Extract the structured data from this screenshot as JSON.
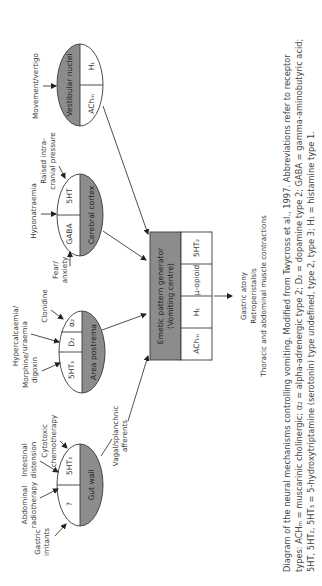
{
  "diagram": {
    "nodes": {
      "gut_wall": {
        "name": "Gut wall",
        "receptors": [
          "?",
          "5HT₃"
        ]
      },
      "area_postrema": {
        "name": "Area postrema",
        "receptors": [
          "5HT₃",
          "D₂",
          "α₂"
        ]
      },
      "cerebral_cortex": {
        "name": "Cerebral cortex",
        "receptors": [
          "GABA",
          "5HT"
        ]
      },
      "vestibular_nuclei": {
        "name": "Vestibular nuclei",
        "receptors": [
          "AChₘ",
          "H₁"
        ]
      },
      "emetic_generator": {
        "name_line1": "Emetic pattern generator",
        "name_line2": "(Vomiting centre)",
        "receptors": [
          "AChₘ",
          "H₁",
          "μ-opioid",
          "5HT₂"
        ]
      }
    },
    "stimuli": {
      "gastric_irritants": [
        "Gastric",
        "irritants"
      ],
      "abdominal_radiotherapy": [
        "Abdominal",
        "radiotherapy"
      ],
      "intestinal_distension": [
        "Intestinal",
        "distension"
      ],
      "cytotoxic_chemotherapy": [
        "Cytotoxic",
        "chemotherapy"
      ],
      "morphine_digoxin": [
        "Morphine/",
        "digoxin"
      ],
      "hypercalcaemia_uraemia": [
        "Hypercalcaemia/",
        "uraemia"
      ],
      "clonidine": [
        "Clonidine"
      ],
      "fear_anxiety": [
        "Fear/",
        "anxiety"
      ],
      "hyponatraemia": [
        "Hyponatraemia"
      ],
      "raised_icp": [
        "Raised intra-",
        "cranial pressure"
      ],
      "movement_vertigo": [
        "Movement/vertigo"
      ],
      "vagal_afferents": [
        "Vagal/splanchnic",
        "afferents"
      ]
    },
    "outputs": [
      "Gastric atony",
      "Retroperistalsis",
      "Thoracic and abdominal muscle contractions"
    ]
  },
  "caption": {
    "line1": "Diagram of the neural mechanisms controlling vomiting. Modified from Twycross et al., 1997. Abbreviations refer to receptor",
    "line2": "types: ACHₘ = muscarinic cholinergic; α₂ = alpha-adrenergic type 2; D₂ = dopamine type 2; GABA = gamma-aminobutyric acid;",
    "line3": "5HT, 5HT₂, 5HT₃ = 5-hydroxytriptamine (serotonin) type undefined, type 2, type 3; H₁ = histamine type 1."
  },
  "colors": {
    "shaded": "#8c8c8c",
    "stroke": "#3a3a3a",
    "text": "#333333"
  }
}
